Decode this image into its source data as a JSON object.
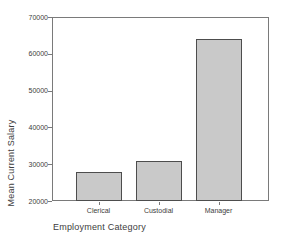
{
  "chart_data": {
    "type": "bar",
    "title": "",
    "categories": [
      "Clerical",
      "Custodial",
      "Manager"
    ],
    "values": [
      27838,
      30938,
      63978
    ],
    "xlabel": "Employment Category",
    "ylabel": "Mean Current Salary",
    "ylim": [
      20000,
      70000
    ],
    "yticks": [
      20000,
      30000,
      40000,
      50000,
      60000,
      70000
    ],
    "ytick_labels": [
      "20000",
      "30000",
      "40000",
      "50000",
      "60000",
      "70000"
    ],
    "grid": false,
    "legend": "none",
    "colors": {
      "bar_fill": "#c9c9c9",
      "bar_border": "#4d4d4d",
      "frame": "#7a7a7a",
      "text": "#3d3d3d",
      "background": "#ffffff"
    }
  }
}
